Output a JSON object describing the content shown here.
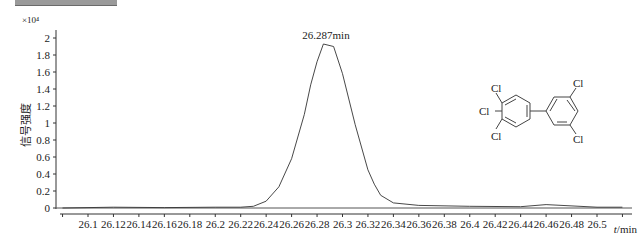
{
  "header": {
    "title_bar_visible": true
  },
  "chart_data": {
    "type": "line",
    "title": "",
    "xlabel": "t/min",
    "ylabel": "信号强度",
    "y_multiplier": "×10⁴",
    "xlim": [
      26.08,
      26.52
    ],
    "ylim": [
      0,
      2.05
    ],
    "grid": false,
    "legend": null,
    "x_ticks": [
      "26.1",
      "26.12",
      "26.14",
      "26.16",
      "26.18",
      "26.2",
      "26.22",
      "26.24",
      "26.26",
      "26.28",
      "26.3",
      "26.32",
      "26.34",
      "26.36",
      "26.38",
      "26.4",
      "26.42",
      "26.44",
      "26.46",
      "26.48",
      "26.5"
    ],
    "y_ticks": [
      "0",
      "0.2",
      "0.4",
      "0.6",
      "0.8",
      "1",
      "1.2",
      "1.4",
      "1.6",
      "1.8",
      "2"
    ],
    "annotations": [
      {
        "text": "26.287min",
        "x": 26.287,
        "y": 1.93
      }
    ],
    "series": [
      {
        "name": "chromatogram",
        "x": [
          26.08,
          26.12,
          26.16,
          26.2,
          26.22,
          26.23,
          26.24,
          26.25,
          26.26,
          26.27,
          26.275,
          26.28,
          26.285,
          26.293,
          26.3,
          26.31,
          26.32,
          26.325,
          26.33,
          26.34,
          26.36,
          26.4,
          26.44,
          26.46,
          26.5,
          26.52
        ],
        "values": [
          0.0,
          0.01,
          0.005,
          0.01,
          0.01,
          0.02,
          0.08,
          0.25,
          0.58,
          1.1,
          1.45,
          1.72,
          1.93,
          1.9,
          1.58,
          0.98,
          0.45,
          0.28,
          0.15,
          0.06,
          0.03,
          0.02,
          0.015,
          0.04,
          0.01,
          0.01
        ]
      }
    ]
  },
  "structure": {
    "name": "3,3',4,5,5'-pentachlorobiphenyl",
    "labels": [
      "Cl",
      "Cl",
      "Cl",
      "Cl",
      "Cl"
    ]
  }
}
